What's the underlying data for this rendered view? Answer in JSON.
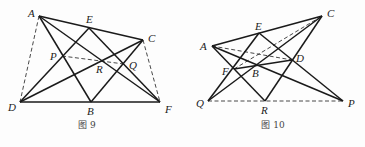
{
  "figures": [
    {
      "caption": "图 9",
      "caption_pos": [
        87,
        128
      ],
      "points": {
        "A": [
          39,
          16
        ],
        "E": [
          89,
          28
        ],
        "C": [
          143,
          40
        ],
        "P": [
          62,
          56
        ],
        "R": [
          100,
          61
        ],
        "Q": [
          124,
          64
        ],
        "D": [
          20,
          102
        ],
        "B": [
          91,
          102
        ],
        "F": [
          160,
          102
        ]
      },
      "labels": [
        {
          "text": "A",
          "x": 28,
          "y": 17
        },
        {
          "text": "E",
          "x": 86,
          "y": 23
        },
        {
          "text": "C",
          "x": 148,
          "y": 42
        },
        {
          "text": "P",
          "x": 50,
          "y": 60
        },
        {
          "text": "R",
          "x": 96,
          "y": 73
        },
        {
          "text": "Q",
          "x": 129,
          "y": 69
        },
        {
          "text": "D",
          "x": 8,
          "y": 111
        },
        {
          "text": "B",
          "x": 87,
          "y": 115
        },
        {
          "text": "F",
          "x": 165,
          "y": 113
        }
      ],
      "solid": [
        [
          "A",
          "C"
        ],
        [
          "A",
          "B"
        ],
        [
          "A",
          "F"
        ],
        [
          "D",
          "F"
        ],
        [
          "D",
          "E"
        ],
        [
          "D",
          "C"
        ],
        [
          "E",
          "F"
        ],
        [
          "B",
          "C"
        ]
      ],
      "dashed": [
        [
          "A",
          "D"
        ],
        [
          "C",
          "F"
        ],
        [
          "P",
          "Q"
        ]
      ]
    },
    {
      "caption": "图 10",
      "caption_pos": [
        273,
        128
      ],
      "points": {
        "C": [
          322,
          16
        ],
        "E": [
          259,
          33
        ],
        "A": [
          212,
          46
        ],
        "D": [
          292,
          60
        ],
        "B": [
          256,
          64
        ],
        "F": [
          234,
          69
        ],
        "Q": [
          208,
          101
        ],
        "R": [
          265,
          101
        ],
        "P": [
          343,
          101
        ]
      },
      "labels": [
        {
          "text": "C",
          "x": 327,
          "y": 17
        },
        {
          "text": "E",
          "x": 255,
          "y": 30
        },
        {
          "text": "A",
          "x": 200,
          "y": 50
        },
        {
          "text": "D",
          "x": 296,
          "y": 62
        },
        {
          "text": "B",
          "x": 252,
          "y": 77
        },
        {
          "text": "F",
          "x": 222,
          "y": 75
        },
        {
          "text": "Q",
          "x": 196,
          "y": 107
        },
        {
          "text": "R",
          "x": 261,
          "y": 114
        },
        {
          "text": "P",
          "x": 348,
          "y": 107
        }
      ],
      "solid": [
        [
          "A",
          "C"
        ],
        [
          "A",
          "P"
        ],
        [
          "A",
          "R"
        ],
        [
          "F",
          "D"
        ],
        [
          "E",
          "Q"
        ],
        [
          "E",
          "P"
        ],
        [
          "Q",
          "C"
        ],
        [
          "R",
          "C"
        ]
      ],
      "dashed": [
        [
          "A",
          "D"
        ],
        [
          "F",
          "C"
        ],
        [
          "Q",
          "P"
        ]
      ]
    }
  ]
}
